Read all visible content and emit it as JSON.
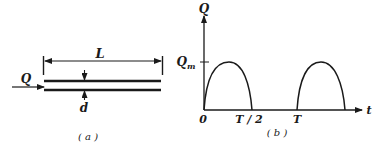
{
  "panel_a": {
    "caption": "( a )",
    "length_label": "L",
    "flow_label": "Q",
    "diameter_label": "d"
  },
  "panel_b": {
    "caption": "( b )",
    "y_axis_label": "Q",
    "x_axis_label": "t",
    "peak_label": "Q",
    "peak_subscript": "m",
    "origin_label": "0",
    "tick_half_period": "T / 2",
    "tick_period": "T"
  },
  "colors": {
    "ink": "#1a1a1a",
    "background": "#ffffff"
  }
}
